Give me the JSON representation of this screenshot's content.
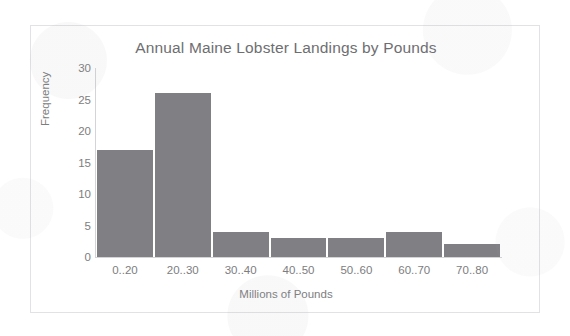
{
  "chart_data": {
    "type": "bar",
    "title": "Annual Maine Lobster Landings by Pounds",
    "xlabel": "Millions of Pounds",
    "ylabel": "Frequency",
    "categories": [
      "0..20",
      "20..30",
      "30..40",
      "40..50",
      "50..60",
      "60..70",
      "70..80"
    ],
    "values": [
      17,
      26,
      4,
      3,
      3,
      4,
      2
    ],
    "yticks": [
      0,
      5,
      10,
      15,
      20,
      25,
      30
    ],
    "ylim": [
      0,
      30
    ],
    "grid": false,
    "legend": "none",
    "bar_color": "#808084",
    "text_color": "#7d7d80",
    "title_color": "#6e6e71",
    "border_color": "#e2e2e4",
    "background": "#ffffff"
  }
}
